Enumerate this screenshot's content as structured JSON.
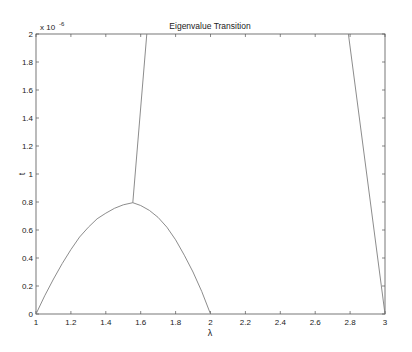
{
  "chart_data": {
    "type": "line",
    "title": "Eigenvalue Transition",
    "xlabel": "λ",
    "ylabel": "t",
    "y_multiplier_label": "x 10",
    "y_multiplier_exponent": "-6",
    "xlim": [
      1,
      3
    ],
    "ylim": [
      0,
      2
    ],
    "y_scale": 1e-06,
    "grid": false,
    "x_ticks": [
      1,
      1.2,
      1.4,
      1.6,
      1.8,
      2,
      2.2,
      2.4,
      2.6,
      2.8,
      3
    ],
    "x_tick_labels": [
      "1",
      "1.2",
      "1.4",
      "1.6",
      "1.8",
      "2",
      "2.2",
      "2.4",
      "2.6",
      "2.8",
      "3"
    ],
    "y_ticks": [
      0,
      0.2,
      0.4,
      0.6,
      0.8,
      1,
      1.2,
      1.4,
      1.6,
      1.8,
      2
    ],
    "y_tick_labels": [
      "0",
      "0.2",
      "0.4",
      "0.6",
      "0.8",
      "1",
      "1.2",
      "1.4",
      "1.6",
      "1.8",
      "2"
    ],
    "series": [
      {
        "name": "lower-arc",
        "x": [
          1.0,
          1.05,
          1.1,
          1.15,
          1.2,
          1.25,
          1.3,
          1.35,
          1.4,
          1.45,
          1.5,
          1.555
        ],
        "y": [
          0.0,
          0.13,
          0.25,
          0.36,
          0.46,
          0.55,
          0.62,
          0.68,
          0.72,
          0.755,
          0.78,
          0.795
        ]
      },
      {
        "name": "falling-arc",
        "x": [
          1.555,
          1.6,
          1.65,
          1.7,
          1.75,
          1.8,
          1.85,
          1.9,
          1.95,
          2.0
        ],
        "y": [
          0.795,
          0.775,
          0.74,
          0.69,
          0.62,
          0.53,
          0.42,
          0.3,
          0.16,
          0.0
        ]
      },
      {
        "name": "upper-branch",
        "x": [
          1.555,
          1.635
        ],
        "y": [
          0.795,
          2.0
        ]
      },
      {
        "name": "right-line",
        "x": [
          2.79,
          3.0
        ],
        "y": [
          2.0,
          0.0
        ]
      }
    ],
    "line_color": "#7f7f7f"
  }
}
